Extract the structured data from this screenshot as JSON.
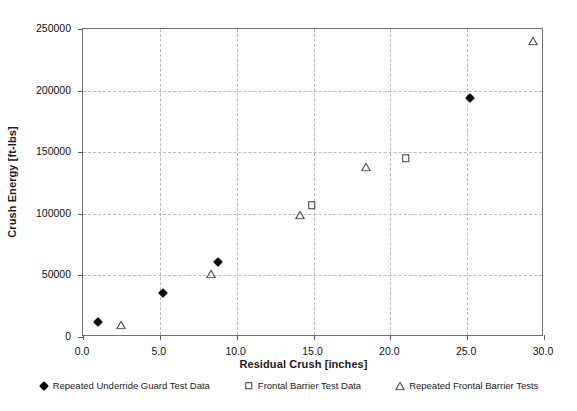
{
  "chart_data": {
    "type": "scatter",
    "title": "",
    "xlabel": "Residual Crush [inches]",
    "ylabel": "Crush Energy [ft-lbs]",
    "xlim": [
      0,
      30
    ],
    "ylim": [
      0,
      250000
    ],
    "xticks": [
      "0.0",
      "5.0",
      "10.0",
      "15.0",
      "20.0",
      "25.0",
      "30.0"
    ],
    "xtick_values": [
      0,
      5,
      10,
      15,
      20,
      25,
      30
    ],
    "yticks": [
      "0",
      "50000",
      "100000",
      "150000",
      "200000",
      "250000"
    ],
    "ytick_values": [
      0,
      50000,
      100000,
      150000,
      200000,
      250000
    ],
    "grid": true,
    "legend_position": "bottom",
    "series": [
      {
        "name": "Repeated Underride Guard Test Data",
        "marker": "filled-diamond",
        "color": "#0d0d0d",
        "points": [
          {
            "x": 1.0,
            "y": 12000
          },
          {
            "x": 5.2,
            "y": 36000
          },
          {
            "x": 8.8,
            "y": 61000
          },
          {
            "x": 25.2,
            "y": 194000
          }
        ]
      },
      {
        "name": "Frontal Barrier Test Data",
        "marker": "open-square",
        "color": "#3b3b3b",
        "points": [
          {
            "x": 14.9,
            "y": 107000
          },
          {
            "x": 21.0,
            "y": 145000
          }
        ]
      },
      {
        "name": "Repeated Frontal Barrier Tests",
        "marker": "open-triangle",
        "color": "#4a4a4a",
        "points": [
          {
            "x": 2.5,
            "y": 10000
          },
          {
            "x": 8.3,
            "y": 51000
          },
          {
            "x": 14.1,
            "y": 99000
          },
          {
            "x": 18.4,
            "y": 138000
          },
          {
            "x": 29.3,
            "y": 240000
          }
        ]
      }
    ]
  }
}
